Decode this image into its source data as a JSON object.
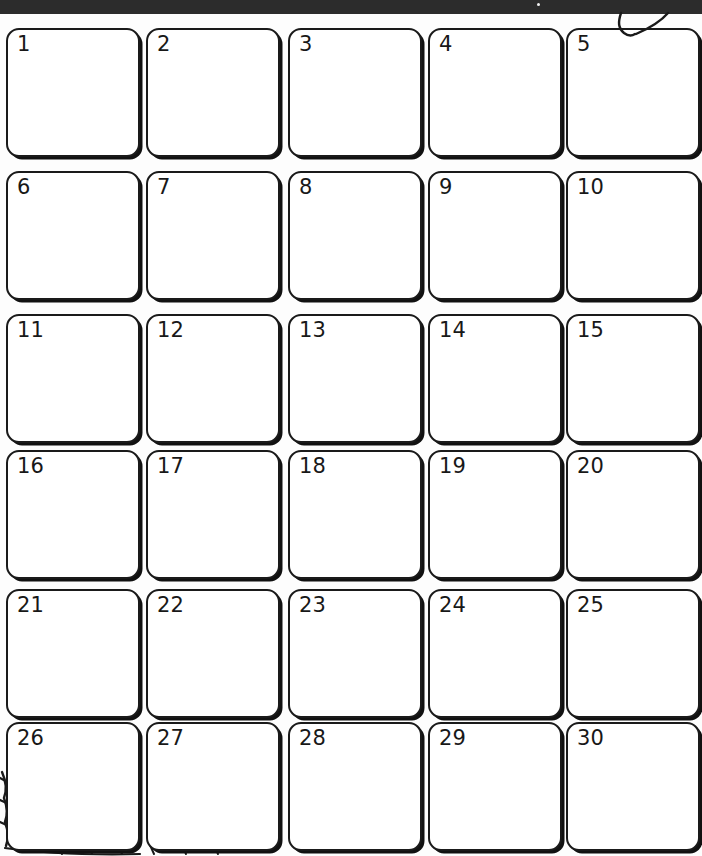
{
  "page": {
    "kind": "printed-blank-calendar-grid",
    "background_color": "#fdfdfd",
    "ink_color": "#1a1a1a"
  },
  "top_bar": {
    "name": "scanner-edge-bar",
    "color": "#2c2c2c",
    "height_px": 14,
    "speck_color": "#f2f2f2"
  },
  "annotations": {
    "top_right_mark": "hand-drawn-curve-pair",
    "bottom_left_mark": "hand-drawn-hatching"
  },
  "grid": {
    "columns": 5,
    "rows": 6,
    "cell_count": 30,
    "cell_width_px": 134,
    "cell_height_px": 129,
    "column_x": [
      6,
      146,
      288,
      428,
      566
    ],
    "row_y": [
      28,
      171,
      314,
      450,
      589,
      722
    ],
    "cells": [
      {
        "number": "1",
        "col": 0,
        "row": 0
      },
      {
        "number": "2",
        "col": 1,
        "row": 0
      },
      {
        "number": "3",
        "col": 2,
        "row": 0
      },
      {
        "number": "4",
        "col": 3,
        "row": 0
      },
      {
        "number": "5",
        "col": 4,
        "row": 0
      },
      {
        "number": "6",
        "col": 0,
        "row": 1
      },
      {
        "number": "7",
        "col": 1,
        "row": 1
      },
      {
        "number": "8",
        "col": 2,
        "row": 1
      },
      {
        "number": "9",
        "col": 3,
        "row": 1
      },
      {
        "number": "10",
        "col": 4,
        "row": 1
      },
      {
        "number": "11",
        "col": 0,
        "row": 2
      },
      {
        "number": "12",
        "col": 1,
        "row": 2
      },
      {
        "number": "13",
        "col": 2,
        "row": 2
      },
      {
        "number": "14",
        "col": 3,
        "row": 2
      },
      {
        "number": "15",
        "col": 4,
        "row": 2
      },
      {
        "number": "16",
        "col": 0,
        "row": 3
      },
      {
        "number": "17",
        "col": 1,
        "row": 3
      },
      {
        "number": "18",
        "col": 2,
        "row": 3
      },
      {
        "number": "19",
        "col": 3,
        "row": 3
      },
      {
        "number": "20",
        "col": 4,
        "row": 3
      },
      {
        "number": "21",
        "col": 0,
        "row": 4
      },
      {
        "number": "22",
        "col": 1,
        "row": 4
      },
      {
        "number": "23",
        "col": 2,
        "row": 4
      },
      {
        "number": "24",
        "col": 3,
        "row": 4
      },
      {
        "number": "25",
        "col": 4,
        "row": 4
      },
      {
        "number": "26",
        "col": 0,
        "row": 5
      },
      {
        "number": "27",
        "col": 1,
        "row": 5
      },
      {
        "number": "28",
        "col": 2,
        "row": 5
      },
      {
        "number": "29",
        "col": 3,
        "row": 5
      },
      {
        "number": "30",
        "col": 4,
        "row": 5
      }
    ]
  }
}
